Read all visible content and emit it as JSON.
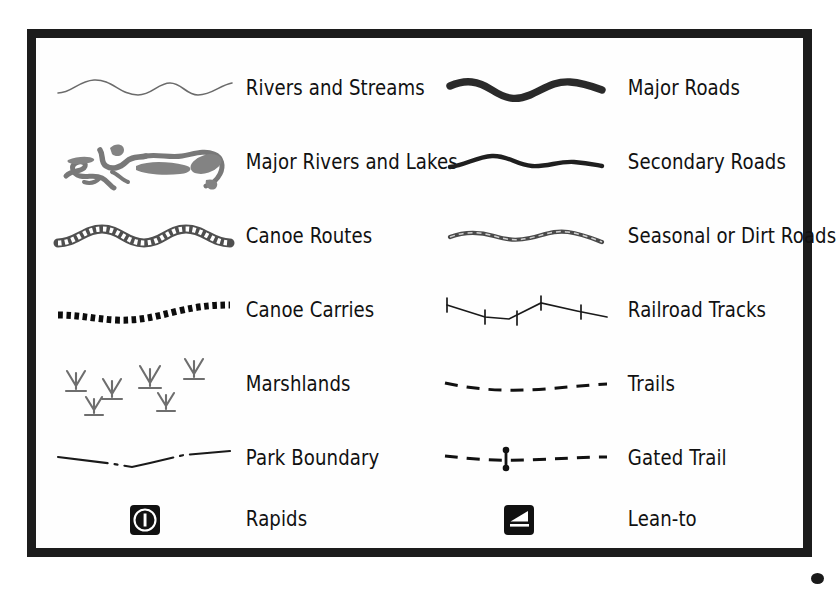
{
  "legend": {
    "title": "Map Legend",
    "frame_color": "#1c1c1c",
    "background_color": "#ffffff",
    "label_color": "#111111",
    "columns": [
      {
        "name": "left-column",
        "entries": [
          {
            "symbol": "thin-wavy-line-symbol",
            "label": "Rivers and Streams",
            "color": "#6b6b6b"
          },
          {
            "symbol": "river-network-lakes-symbol",
            "label": "Major Rivers and Lakes",
            "color": "#787878"
          },
          {
            "symbol": "beaded-wavy-band-symbol",
            "label": "Canoe Routes",
            "color": "#555555"
          },
          {
            "symbol": "square-dotted-line-symbol",
            "label": "Canoe Carries",
            "color": "#0d0d0d"
          },
          {
            "symbol": "marsh-grass-tufts-symbol",
            "label": "Marshlands",
            "color": "#6e6e6e"
          },
          {
            "symbol": "dash-dot-line-symbol",
            "label": "Park Boundary",
            "color": "#1a1a1a"
          },
          {
            "symbol": "rapids-icon",
            "label": "Rapids",
            "color": "#111111"
          }
        ]
      },
      {
        "name": "right-column",
        "entries": [
          {
            "symbol": "thick-wavy-line-symbol",
            "label": "Major Roads",
            "color": "#2a2a2a"
          },
          {
            "symbol": "medium-wavy-line-symbol",
            "label": "Secondary Roads",
            "color": "#1f1f1f"
          },
          {
            "symbol": "mottled-thin-line-symbol",
            "label": "Seasonal or Dirt Roads",
            "color": "#4a4a4a"
          },
          {
            "symbol": "railroad-tick-line-symbol",
            "label": "Railroad Tracks",
            "color": "#1a1a1a"
          },
          {
            "symbol": "dashed-line-symbol",
            "label": "Trails",
            "color": "#111111"
          },
          {
            "symbol": "gated-dashed-line-symbol",
            "label": "Gated Trail",
            "color": "#111111"
          },
          {
            "symbol": "lean-to-icon",
            "label": "Lean-to",
            "color": "#111111"
          }
        ]
      }
    ]
  }
}
